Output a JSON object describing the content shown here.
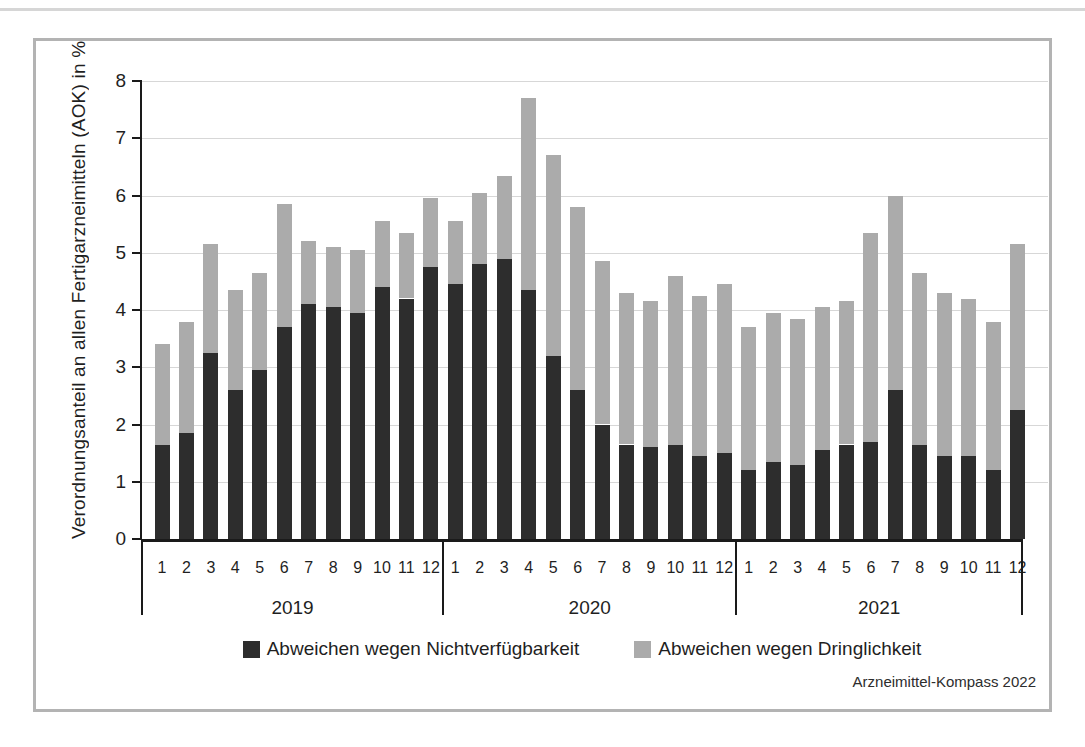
{
  "figure": {
    "source": "Arzneimittel-Kompass 2022"
  },
  "chart_data": {
    "type": "bar",
    "stacked": true,
    "title": "",
    "xlabel": "",
    "ylabel": "Verordnungsanteil an allen Fertigarzneimitteln (AOK) in %",
    "ylim": [
      0,
      8
    ],
    "yticks": [
      0,
      1,
      2,
      3,
      4,
      5,
      6,
      7,
      8
    ],
    "grid": true,
    "legend_position": "bottom",
    "years": [
      "2019",
      "2020",
      "2021"
    ],
    "months": [
      "1",
      "2",
      "3",
      "4",
      "5",
      "6",
      "7",
      "8",
      "9",
      "10",
      "11",
      "12"
    ],
    "series": [
      {
        "name": "Abweichen wegen Nichtverfügbarkeit",
        "color": "#2d2d2d",
        "values": [
          1.65,
          1.85,
          3.25,
          2.6,
          2.95,
          3.7,
          4.1,
          4.05,
          3.95,
          4.4,
          4.2,
          4.75,
          4.45,
          4.8,
          4.9,
          4.35,
          3.2,
          2.6,
          2.0,
          1.65,
          1.6,
          1.65,
          1.45,
          1.5,
          1.2,
          1.35,
          1.3,
          1.55,
          1.65,
          1.7,
          2.6,
          1.65,
          1.45,
          1.45,
          1.2,
          2.25
        ]
      },
      {
        "name": "Abweichen wegen Dringlichkeit",
        "color": "#ababab",
        "values": [
          1.75,
          1.95,
          1.9,
          1.75,
          1.7,
          2.15,
          1.1,
          1.05,
          1.1,
          1.15,
          1.15,
          1.2,
          1.1,
          1.25,
          1.45,
          3.35,
          3.5,
          3.2,
          2.85,
          2.65,
          2.55,
          2.95,
          2.8,
          2.95,
          2.5,
          2.6,
          2.55,
          2.5,
          2.5,
          3.65,
          3.4,
          3.0,
          2.85,
          2.75,
          2.6,
          2.9
        ]
      }
    ],
    "stack_totals": [
      3.4,
      3.8,
      5.15,
      4.35,
      4.65,
      5.85,
      5.2,
      5.1,
      5.05,
      5.55,
      5.35,
      5.95,
      5.55,
      6.05,
      6.35,
      7.7,
      6.7,
      5.8,
      4.85,
      4.3,
      4.15,
      4.6,
      4.25,
      4.45,
      3.7,
      3.95,
      3.85,
      4.05,
      4.15,
      5.35,
      6.0,
      4.65,
      4.3,
      4.2,
      3.8,
      5.15
    ]
  }
}
